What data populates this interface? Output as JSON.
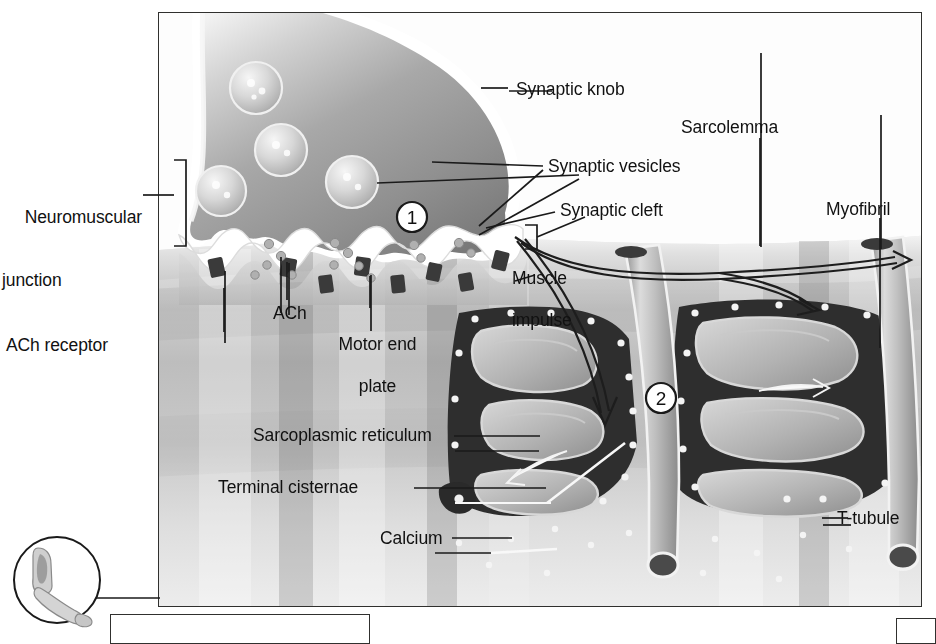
{
  "figure": {
    "frame": {
      "x": 158,
      "y": 12,
      "w": 764,
      "h": 595
    },
    "background_color": "#fdfdfd",
    "line_color": "#1a1a1a"
  },
  "labels": {
    "neuromuscular_junction": "Neuromuscular\njunction",
    "neuromuscular_junction_line1": "Neuromuscular",
    "neuromuscular_junction_line2": "junction",
    "ach_receptor": "ACh receptor",
    "ach": "ACh",
    "motor_end_plate_line1": "Motor end",
    "motor_end_plate_line2": "plate",
    "synaptic_knob": "Synaptic knob",
    "synaptic_vesicles": "Synaptic vesicles",
    "synaptic_cleft": "Synaptic cleft",
    "muscle_impulse_line1": "Muscle",
    "muscle_impulse_line2": "impulse",
    "sarcolemma": "Sarcolemma",
    "myofibril": "Myofibril",
    "sarcoplasmic_reticulum": "Sarcoplasmic reticulum",
    "terminal_cisternae": "Terminal cisternae",
    "calcium": "Calcium",
    "t_tubule": "T-tubule"
  },
  "step_markers": [
    {
      "id": "step-1",
      "number": "1",
      "x": 411,
      "y": 216
    },
    {
      "id": "step-2",
      "number": "2",
      "x": 660,
      "y": 397
    }
  ],
  "inset": {
    "name": "flexed-arm-inset",
    "cx": 55,
    "cy": 580,
    "r": 43,
    "description": "flexed arm"
  }
}
